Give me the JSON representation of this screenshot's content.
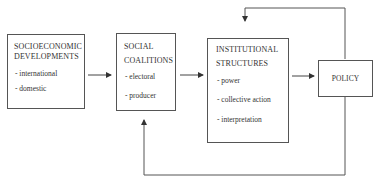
{
  "diagram": {
    "nodes": [
      {
        "id": "socioeconomic",
        "title_lines": [
          "SOCIOECONOMIC",
          "DEVELOPMENTS"
        ],
        "items": [
          "- international",
          "- domestic"
        ]
      },
      {
        "id": "social-coalitions",
        "title_lines": [
          "SOCIAL",
          "COALITIONS"
        ],
        "items": [
          "- electoral",
          "- producer"
        ]
      },
      {
        "id": "institutional-structures",
        "title_lines": [
          "INSTITUTIONAL",
          "STRUCTURES"
        ],
        "items": [
          "- power",
          "- collective action",
          "- interpretation"
        ]
      },
      {
        "id": "policy",
        "title_lines": [
          "POLICY"
        ],
        "items": []
      }
    ],
    "edges": [
      {
        "from": "socioeconomic",
        "to": "social-coalitions"
      },
      {
        "from": "social-coalitions",
        "to": "institutional-structures"
      },
      {
        "from": "institutional-structures",
        "to": "policy"
      },
      {
        "from": "policy",
        "to": "institutional-structures",
        "type": "feedback-top"
      },
      {
        "from": "policy",
        "to": "social-coalitions",
        "type": "feedback-bottom"
      }
    ],
    "colors": {
      "line": "#555555",
      "text": "#333333",
      "background": "#ffffff"
    }
  }
}
